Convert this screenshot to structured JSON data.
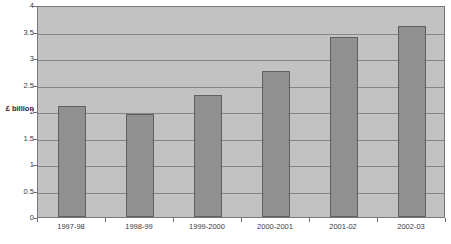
{
  "chart_data": {
    "type": "bar",
    "title": "",
    "xlabel": "",
    "ylabel": "£ billion",
    "categories": [
      "1997-98",
      "1998-99",
      "1999-2000",
      "2000-2001",
      "2001-02",
      "2002-03"
    ],
    "values": [
      2.1,
      1.95,
      2.3,
      2.75,
      3.4,
      3.6
    ],
    "ylim": [
      0,
      4
    ],
    "ytick_step": 0.5,
    "yticks": [
      "0",
      "0.5",
      "1",
      "1.5",
      "2",
      "2.5",
      "3",
      "3.5",
      "4"
    ],
    "ytick_values": [
      0,
      0.5,
      1,
      1.5,
      2,
      2.5,
      3,
      3.5,
      4
    ],
    "grid": true,
    "legend": false,
    "legend_position": "none",
    "colors": {
      "bar_fill": "#919191",
      "bar_border": "#5e5e63",
      "plot_background": "#c2c2c2",
      "gridline": "#85858d",
      "axis": "#76767e",
      "text": "#3a3a44"
    }
  },
  "axis": {
    "y_title": "£ billion"
  }
}
